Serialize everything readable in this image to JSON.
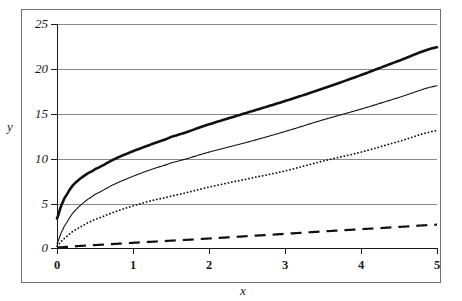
{
  "chart_data": {
    "type": "line",
    "title": "",
    "subtitle": "",
    "xlabel": "x",
    "ylabel": "y",
    "xlim": [
      0,
      5
    ],
    "ylim": [
      0,
      25
    ],
    "xticks": [
      "0",
      "1",
      "2",
      "3",
      "4",
      "5"
    ],
    "yticks": [
      "0",
      "5",
      "10",
      "15",
      "20",
      "25"
    ],
    "grid": "horizontal",
    "legend": "none",
    "x": [
      0,
      0.05,
      0.1,
      0.2,
      0.3,
      0.4,
      0.5,
      0.75,
      1,
      1.25,
      1.5,
      2,
      2.5,
      3,
      3.5,
      4,
      4.5,
      5
    ],
    "series": [
      {
        "name": "thick-solid-curve",
        "style": "solid",
        "width": 2.6,
        "color": "#111111",
        "values": [
          3.3,
          4.6,
          5.6,
          6.9,
          7.7,
          8.3,
          8.8,
          9.9,
          10.8,
          11.6,
          12.4,
          13.8,
          15.1,
          16.4,
          17.8,
          19.3,
          20.9,
          22.4
        ]
      },
      {
        "name": "thin-solid-curve",
        "style": "solid",
        "width": 1.1,
        "color": "#111111",
        "values": [
          0.5,
          1.6,
          2.5,
          3.8,
          4.7,
          5.4,
          6.0,
          7.1,
          8.0,
          8.8,
          9.5,
          10.7,
          11.8,
          13.0,
          14.3,
          15.5,
          16.8,
          18.1
        ]
      },
      {
        "name": "dotted-curve",
        "style": "dotted",
        "width": 1.8,
        "color": "#111111",
        "values": [
          0.2,
          0.7,
          1.1,
          1.8,
          2.3,
          2.8,
          3.2,
          4.0,
          4.7,
          5.3,
          5.8,
          6.8,
          7.7,
          8.6,
          9.7,
          10.7,
          11.9,
          13.1
        ]
      },
      {
        "name": "dashed-curve",
        "style": "dashed",
        "width": 2.2,
        "color": "#111111",
        "values": [
          0.05,
          0.08,
          0.11,
          0.17,
          0.23,
          0.28,
          0.33,
          0.45,
          0.58,
          0.7,
          0.82,
          1.06,
          1.32,
          1.58,
          1.85,
          2.1,
          2.35,
          2.6
        ]
      }
    ],
    "axis_title_x": "x",
    "axis_title_y": "y"
  },
  "axes": {
    "y_title": "y",
    "x_title": "x",
    "y_tick_labels": [
      "25",
      "20",
      "15",
      "10",
      "5",
      "0"
    ],
    "x_tick_labels": [
      "0",
      "1",
      "2",
      "3",
      "4",
      "5"
    ]
  },
  "colors": {
    "line": "#111111",
    "grid": "#8a8a8a",
    "axis": "#1a1a1a",
    "frame": "#6f6f6f",
    "background": "#ffffff"
  }
}
